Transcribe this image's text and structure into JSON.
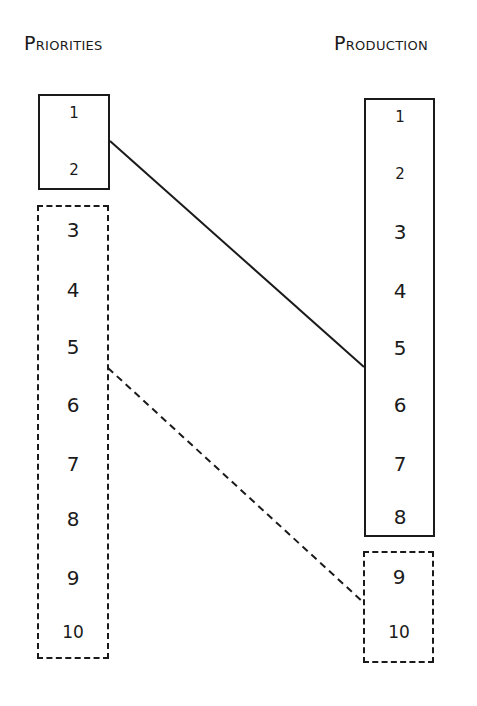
{
  "diagram": {
    "left_column": {
      "title": "Priorities",
      "items": [
        "1",
        "2",
        "3",
        "4",
        "5",
        "6",
        "7",
        "8",
        "9",
        "10"
      ],
      "solid_group": [
        "1",
        "2"
      ],
      "dashed_group": [
        "3",
        "4",
        "5",
        "6",
        "7",
        "8",
        "9",
        "10"
      ]
    },
    "right_column": {
      "title": "Production",
      "items": [
        "1",
        "2",
        "3",
        "4",
        "5",
        "6",
        "7",
        "8",
        "9",
        "10"
      ],
      "solid_group": [
        "1",
        "2",
        "3",
        "4",
        "5",
        "6",
        "7",
        "8"
      ],
      "dashed_group": [
        "9",
        "10"
      ]
    },
    "connectors": [
      {
        "style": "solid",
        "from": "Priorities box 1-2 (right edge, between 1 and 2)",
        "to": "Production box 1-8 (left edge, between 5 and 6)"
      },
      {
        "style": "dashed",
        "from": "Priorities box 3-10 (right edge, between 5 and 6)",
        "to": "Production box 9-10 (left edge, between 9 and 10)"
      }
    ]
  }
}
